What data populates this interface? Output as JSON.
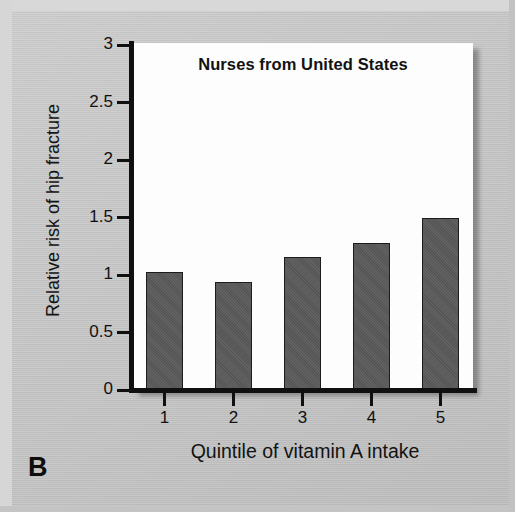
{
  "panel": {
    "label": "B"
  },
  "chart_data": {
    "type": "bar",
    "title": "Nurses from United States",
    "xlabel": "Quintile of vitamin A intake",
    "ylabel": "Relative risk of hip fracture",
    "categories": [
      "1",
      "2",
      "3",
      "4",
      "5"
    ],
    "values": [
      1.03,
      0.94,
      1.16,
      1.28,
      1.5
    ],
    "ylim": [
      0,
      3
    ],
    "ytick_values": [
      0,
      0.5,
      1,
      1.5,
      2,
      2.5,
      3
    ],
    "ytick_labels": [
      "0",
      "0.5",
      "1",
      "1.5",
      "2",
      "2.5",
      "3"
    ],
    "xtick_labels": [
      "1",
      "2",
      "3",
      "4",
      "5"
    ],
    "grid": false,
    "legend": null,
    "bar_color": "#5a5a5a",
    "bar_edge_color": "#1c1c1c",
    "plot_background": "#fdfdfd",
    "figure_background": "#c7c7c7",
    "axis_color": "#101010"
  }
}
